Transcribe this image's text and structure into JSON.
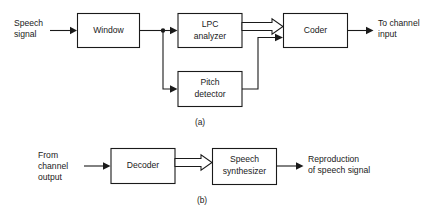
{
  "figure": {
    "line_color": "#1a1a1a",
    "background": "#ffffff"
  },
  "panel_a": {
    "caption": "(a)",
    "input_label_line1": "Speech",
    "input_label_line2": "signal",
    "output_label_line1": "To channel",
    "output_label_line2": "input",
    "blocks": [
      {
        "id": "window",
        "label": "Window"
      },
      {
        "id": "lpc-analyzer",
        "label_line1": "LPC",
        "label_line2": "analyzer"
      },
      {
        "id": "pitch-detector",
        "label_line1": "Pitch",
        "label_line2": "detector"
      },
      {
        "id": "coder",
        "label": "Coder"
      }
    ]
  },
  "panel_b": {
    "caption": "(b)",
    "input_label_line1": "From",
    "input_label_line2": "channel",
    "input_label_line3": "output",
    "output_label_line1": "Reproduction",
    "output_label_line2": "of speech signal",
    "blocks": [
      {
        "id": "decoder",
        "label": "Decoder"
      },
      {
        "id": "speech-synthesizer",
        "label_line1": "Speech",
        "label_line2": "synthesizer"
      }
    ]
  }
}
